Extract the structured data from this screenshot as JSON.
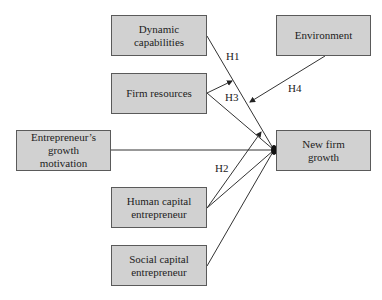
{
  "diagram": {
    "type": "conceptual-model",
    "nodes": {
      "dynamic_capabilities": {
        "label": "Dynamic capabilities"
      },
      "firm_resources": {
        "label": "Firm resources"
      },
      "environment": {
        "label": "Environment"
      },
      "entrepreneur_motivation": {
        "label": "Entrepreneur’s growth motivation"
      },
      "new_firm_growth": {
        "label": "New firm growth"
      },
      "human_capital": {
        "label": "Human capital entrepreneur"
      },
      "social_capital": {
        "label": "Social capital entrepreneur"
      }
    },
    "hypotheses": {
      "h1": "H1",
      "h2": "H2",
      "h3": "H3",
      "h4": "H4"
    },
    "edges": [
      {
        "from": "Dynamic capabilities",
        "to": "New firm growth",
        "label": "H1"
      },
      {
        "from": "Firm resources",
        "to": "H1 path",
        "label": "H3",
        "type": "moderation"
      },
      {
        "from": "Firm resources",
        "to": "New firm growth"
      },
      {
        "from": "Environment",
        "to": "H1 path",
        "label": "H4",
        "type": "moderation"
      },
      {
        "from": "Entrepreneur’s growth motivation",
        "to": "New firm growth"
      },
      {
        "from": "Human capital entrepreneur",
        "to": "Firm resources → New firm growth path",
        "label": "H2",
        "type": "moderation"
      },
      {
        "from": "Human capital entrepreneur",
        "to": "New firm growth"
      },
      {
        "from": "Social capital entrepreneur",
        "to": "New firm growth"
      }
    ],
    "colors": {
      "box_fill": "#d1d1d1",
      "box_border": "#5a5a5a",
      "line": "#333333"
    }
  }
}
